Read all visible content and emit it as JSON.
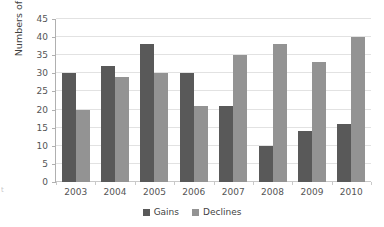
{
  "chart_data": {
    "type": "bar",
    "title": "",
    "subtitle": "",
    "xlabel": "",
    "ylabel": "Numbers of countries",
    "categories": [
      "2003",
      "2004",
      "2005",
      "2006",
      "2007",
      "2008",
      "2009",
      "2010"
    ],
    "series": [
      {
        "name": "Gains",
        "color": "#595959",
        "values": [
          30,
          32,
          38,
          30,
          21,
          10,
          14,
          16
        ]
      },
      {
        "name": "Declines",
        "color": "#939393",
        "values": [
          20,
          29,
          30,
          21,
          35,
          38,
          33,
          40
        ]
      }
    ],
    "ylim": [
      0,
      45
    ],
    "ytick_step": 5,
    "ytick_labels": [
      "45",
      "40",
      "35",
      "30",
      "25",
      "20",
      "15",
      "10",
      "5",
      "0"
    ],
    "grid": true,
    "grid_axis": "y",
    "legend_position": "bottom-center",
    "legend_entries": [
      "Gains",
      "Declines"
    ],
    "background_color": "#ffffff",
    "gridline_color": "#e2e2e2",
    "axis_color": "#b0b0b0",
    "text_color": "#3f3f3f"
  },
  "artifact": {
    "edge_text": "t"
  }
}
